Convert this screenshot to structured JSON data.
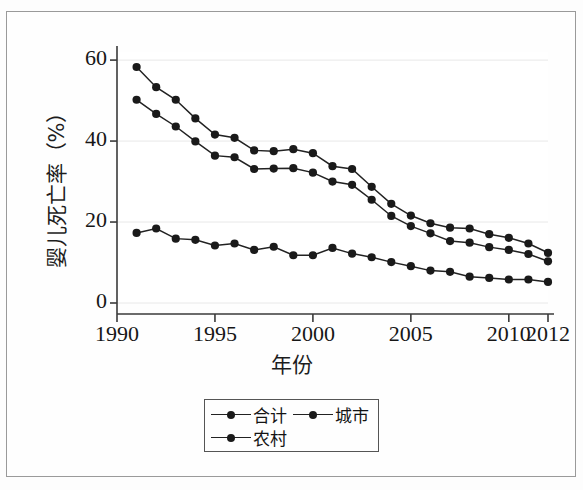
{
  "figure": {
    "background_color": "#fdfdfd",
    "frame_color": "#9a9a9a"
  },
  "axis": {
    "y_title": "婴儿死亡率（%）",
    "x_title": "年份",
    "y_ticks": [
      "0",
      "20",
      "40",
      "60"
    ],
    "x_ticks": [
      "1990",
      "1995",
      "2000",
      "2005",
      "2010",
      "2012"
    ]
  },
  "legend": {
    "items": [
      {
        "label": "合计",
        "color": "#1a1a1a"
      },
      {
        "label": "城市",
        "color": "#1a1a1a"
      },
      {
        "label": "农村",
        "color": "#1a1a1a"
      }
    ]
  },
  "chart_data": {
    "type": "line",
    "title": "",
    "subtitle": "",
    "xlabel": "年份",
    "ylabel": "婴儿死亡率（%）",
    "xlim": [
      1990,
      2012
    ],
    "ylim": [
      0,
      62
    ],
    "xticks": [
      1990,
      1995,
      2000,
      2005,
      2010,
      2012
    ],
    "yticks": [
      0,
      20,
      40,
      60
    ],
    "grid": true,
    "legend_position": "below-center",
    "marker": "filled-circle",
    "line_color": "#222222",
    "x": [
      1991,
      1992,
      1993,
      1994,
      1995,
      1996,
      1997,
      1998,
      1999,
      2000,
      2001,
      2002,
      2003,
      2004,
      2005,
      2006,
      2007,
      2008,
      2009,
      2010,
      2011,
      2012
    ],
    "series": [
      {
        "name": "农村",
        "values": [
          58.3,
          53.3,
          50.2,
          45.6,
          41.6,
          40.8,
          37.7,
          37.5,
          38.0,
          37.0,
          33.8,
          33.1,
          28.7,
          24.5,
          21.6,
          19.7,
          18.6,
          18.4,
          17.0,
          16.1,
          14.7,
          12.4
        ]
      },
      {
        "name": "合计",
        "values": [
          50.2,
          46.7,
          43.6,
          39.9,
          36.4,
          36.0,
          33.1,
          33.2,
          33.3,
          32.2,
          30.0,
          29.2,
          25.5,
          21.5,
          19.0,
          17.2,
          15.3,
          14.9,
          13.8,
          13.1,
          12.1,
          10.3
        ]
      },
      {
        "name": "城市",
        "values": [
          17.3,
          18.4,
          15.9,
          15.6,
          14.2,
          14.7,
          13.1,
          13.9,
          11.8,
          11.8,
          13.6,
          12.2,
          11.3,
          10.1,
          9.1,
          8.0,
          7.7,
          6.5,
          6.2,
          5.8,
          5.8,
          5.2
        ]
      }
    ]
  }
}
